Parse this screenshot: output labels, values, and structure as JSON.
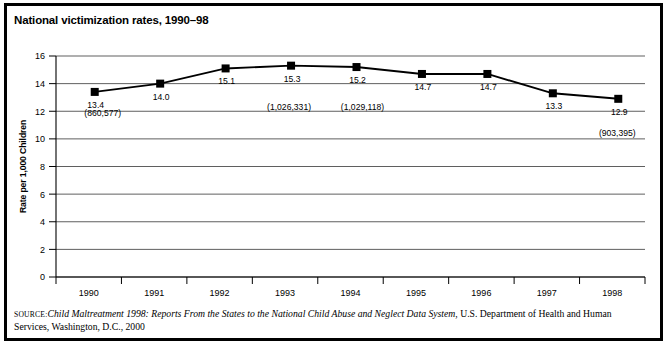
{
  "figure": {
    "title": "National victimization rates, 1990–98"
  },
  "source": {
    "kicker": "source:",
    "italic_part": "Child Maltreatment 1998: Reports From the States to the National Child Abuse and Neglect Data System",
    "rest_part": ", U.S. Department of Health and Human Services, Washington, D.C., 2000"
  },
  "chart_data": {
    "type": "line",
    "title": "National victimization rates, 1990–98",
    "xlabel": "",
    "ylabel": "Rate per 1,000 Children",
    "categories": [
      "1990",
      "1991",
      "1992",
      "1993",
      "1994",
      "1995",
      "1996",
      "1997",
      "1998"
    ],
    "values": [
      13.4,
      14.0,
      15.1,
      15.3,
      15.2,
      14.7,
      14.7,
      13.3,
      12.9
    ],
    "point_labels": [
      "13.4",
      "14.0",
      "15.1",
      "15.3",
      "15.2",
      "14.7",
      "14.7",
      "13.3",
      "12.9"
    ],
    "count_labels": [
      {
        "category": "1990",
        "text": "(860,577)"
      },
      {
        "category": "1993",
        "text": "(1,026,331)"
      },
      {
        "category": "1994",
        "text": "(1,029,118)"
      },
      {
        "category": "1998",
        "text": "(903,395)"
      }
    ],
    "ylim": [
      0,
      16
    ],
    "yticks": [
      0,
      2,
      4,
      6,
      8,
      10,
      12,
      14,
      16
    ],
    "ytick_labels": [
      "0",
      "2",
      "4",
      "6",
      "8",
      "10",
      "12",
      "14",
      "16"
    ],
    "grid": true,
    "legend": false,
    "marker": "square",
    "line_color": "#000000",
    "marker_color": "#000000",
    "grid_color": "#1a1a1a"
  }
}
